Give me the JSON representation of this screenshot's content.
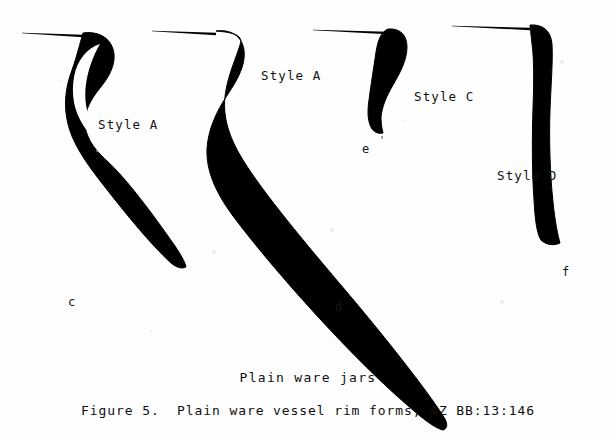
{
  "figure": {
    "caption_subtitle": "Plain ware jars",
    "caption_main": "Figure 5.  Plain ware vessel rim forms, AZ BB:13:146",
    "background_color": "#fefefe",
    "ink_color": "#000000"
  },
  "specimens": [
    {
      "id": "c",
      "letter": "c",
      "style_label": "Style A",
      "style_label_x": 98,
      "style_label_y": 119,
      "letter_x": 68,
      "letter_y": 296,
      "orifice_line": {
        "x1": 22,
        "y1": 33,
        "x2": 83,
        "y2": 36
      },
      "profile_path": "M 83 33 C 96 31 109 36 113 49 C 117 62 110 76 100 88 C 91 99 85 110 85 122 C 85 136 93 148 106 160 C 126 178 152 213 175 246 C 181 255 185 262 186 267 C 182 269 177 268 171 263 C 150 244 122 209 101 182 C 83 159 72 141 68 124 C 63 104 66 86 72 70 C 77 56 80 43 83 33 Z",
      "inner_notch": "M 100 44 C 93 56 88 70 86 84 C 84 98 86 112 92 124 C 96 132 102 140 110 148 C 100 144 90 136 83 125 C 74 111 71 94 74 77 C 77 60 87 48 100 44 Z"
    },
    {
      "id": "d",
      "letter": "d",
      "style_label": "Style A",
      "style_label_x": 261,
      "style_label_y": 70,
      "letter_x": 335,
      "letter_y": 301,
      "orifice_line": {
        "x1": 152,
        "y1": 31,
        "x2": 216,
        "y2": 34
      },
      "profile_path": "M 216 31 C 231 29 242 36 244 50 C 246 64 238 79 228 94 C 216 112 208 130 207 149 C 206 171 216 193 233 216 C 268 263 352 360 420 416 C 430 424 438 429 443 430 C 447 429 448 425 445 419 C 434 400 392 345 340 284 C 296 232 258 186 240 155 C 226 131 222 110 226 90 C 229 73 236 58 240 45 C 242 38 241 33 216 31 Z",
      "inner_notch": ""
    },
    {
      "id": "e",
      "letter": "e",
      "style_label": "Style C",
      "style_label_x": 414,
      "style_label_y": 91,
      "letter_x": 362,
      "letter_y": 143,
      "tick_mark": "'",
      "tick_x": 379,
      "tick_y": 136,
      "orifice_line": {
        "x1": 313,
        "y1": 30,
        "x2": 388,
        "y2": 33
      },
      "profile_path": "M 388 29 C 400 28 407 35 407 47 C 407 60 400 73 393 85 C 386 97 382 107 381 117 C 381 124 382 129 383 133 C 380 134 375 133 372 129 C 368 123 367 113 369 100 C 371 84 374 66 376 52 C 378 40 381 32 388 29 Z",
      "inner_notch": ""
    },
    {
      "id": "f",
      "letter": "f",
      "style_label": "Style D",
      "style_label_x": 497,
      "style_label_y": 170,
      "letter_x": 562,
      "letter_y": 266,
      "orifice_line": {
        "x1": 452,
        "y1": 26,
        "x2": 530,
        "y2": 29
      },
      "profile_path": "M 530 25 C 543 24 551 31 552 44 C 553 60 551 84 550 110 C 549 140 550 174 553 202 C 555 222 558 236 560 243 C 554 246 546 245 541 240 C 537 234 535 220 534 200 C 532 172 532 138 533 108 C 534 82 534 58 532 44 C 531 33 530 28 530 25 Z",
      "inner_notch": ""
    }
  ]
}
